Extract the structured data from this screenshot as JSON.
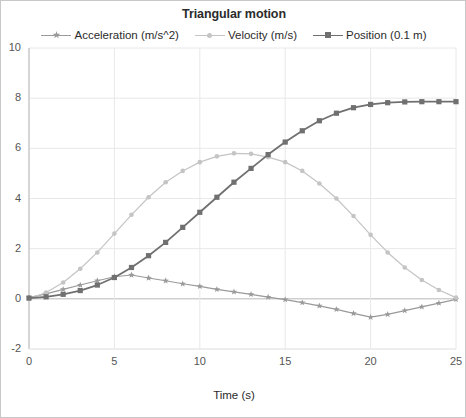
{
  "chart_data": {
    "type": "line",
    "title": "Triangular motion",
    "xlabel": "Time (s)",
    "ylabel": "",
    "xlim": [
      0,
      25
    ],
    "ylim": [
      -2,
      10
    ],
    "xticks": [
      0,
      5,
      10,
      15,
      20,
      25
    ],
    "yticks": [
      -2,
      0,
      2,
      4,
      6,
      8,
      10
    ],
    "xtick_labels": [
      "0",
      "5",
      "10",
      "15",
      "20",
      "25"
    ],
    "ytick_labels": [
      "-2",
      "0",
      "2",
      "4",
      "6",
      "8",
      "10"
    ],
    "grid": true,
    "grid_axis": "both",
    "legend_position": "top-center",
    "x": [
      0,
      1,
      2,
      3,
      4,
      5,
      6,
      7,
      8,
      9,
      10,
      11,
      12,
      13,
      14,
      15,
      16,
      17,
      18,
      19,
      20,
      21,
      22,
      23,
      24,
      25
    ],
    "series": [
      {
        "name": "Acceleration (m/s^2)",
        "color": "#9a9a9a",
        "marker": "star",
        "values": [
          0.05,
          0.2,
          0.38,
          0.55,
          0.72,
          0.88,
          0.95,
          0.83,
          0.72,
          0.6,
          0.5,
          0.38,
          0.28,
          0.18,
          0.07,
          -0.03,
          -0.15,
          -0.28,
          -0.42,
          -0.58,
          -0.73,
          -0.62,
          -0.47,
          -0.32,
          -0.17,
          -0.02
        ]
      },
      {
        "name": "Velocity (m/s)",
        "color": "#c4c4c4",
        "marker": "dot",
        "values": [
          0.0,
          0.25,
          0.65,
          1.2,
          1.85,
          2.6,
          3.35,
          4.05,
          4.65,
          5.1,
          5.45,
          5.68,
          5.8,
          5.78,
          5.65,
          5.45,
          5.1,
          4.6,
          4.0,
          3.3,
          2.55,
          1.85,
          1.25,
          0.75,
          0.35,
          0.05
        ]
      },
      {
        "name": "Position (0.1 m)",
        "color": "#707070",
        "marker": "square",
        "values": [
          0.03,
          0.08,
          0.18,
          0.33,
          0.55,
          0.85,
          1.25,
          1.72,
          2.25,
          2.85,
          3.45,
          4.05,
          4.65,
          5.2,
          5.75,
          6.25,
          6.7,
          7.1,
          7.4,
          7.62,
          7.75,
          7.82,
          7.85,
          7.86,
          7.86,
          7.86
        ]
      }
    ]
  },
  "legend": {
    "items": [
      {
        "label": "Acceleration (m/s^2)"
      },
      {
        "label": "Velocity (m/s)"
      },
      {
        "label": "Position (0.1 m)"
      }
    ]
  },
  "colors": {
    "acceleration": "#9a9a9a",
    "velocity": "#c4c4c4",
    "position": "#707070",
    "grid": "#e8e8e8",
    "axis": "#b8b8b8",
    "text": "#2b2b2b",
    "tick_text": "#555555",
    "border": "#c8c8c8",
    "background": "#ffffff"
  }
}
